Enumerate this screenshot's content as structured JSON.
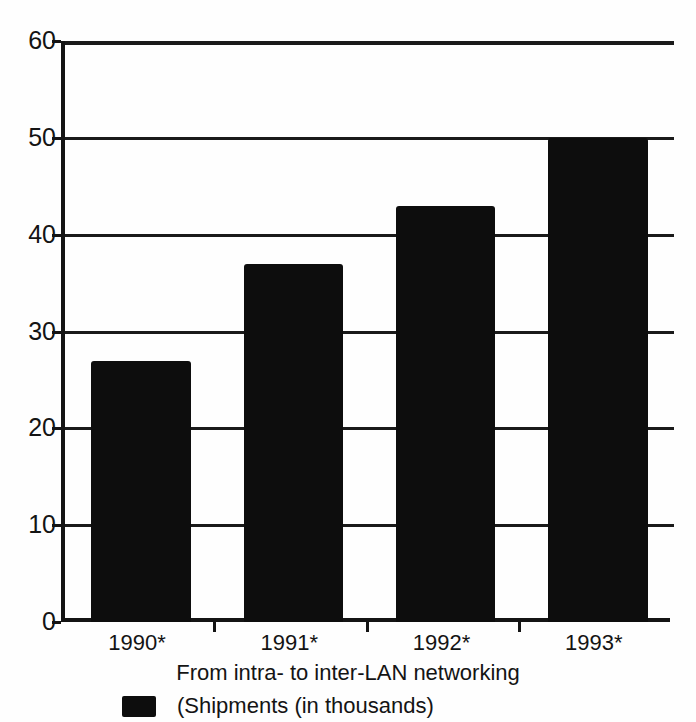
{
  "chart_data": {
    "type": "bar",
    "title": "",
    "subtitle": "",
    "caption": "From intra- to inter-LAN networking",
    "categories": [
      "1990*",
      "1991*",
      "1992*",
      "1993*"
    ],
    "values": [
      27,
      37,
      43,
      50
    ],
    "series": [
      {
        "name": "(Shipments (in thousands)",
        "values": [
          27,
          37,
          43,
          50
        ]
      }
    ],
    "xlabel": "",
    "ylabel": "",
    "ylim": [
      0,
      60
    ],
    "ytick_labels": [
      "0",
      "10",
      "20",
      "30",
      "40",
      "50",
      "60"
    ],
    "ytick_values": [
      0,
      10,
      20,
      30,
      40,
      50,
      60
    ],
    "grid": true,
    "grid_axis": "y",
    "legend_position": "bottom-left",
    "legend_entries": [
      {
        "label": "(Shipments (in thousands)",
        "color": "#0d0d0d"
      }
    ],
    "bar_color": "#0d0d0d",
    "axis_color": "#141414",
    "background_color": "#fefefe",
    "footnote_marker": "*"
  }
}
